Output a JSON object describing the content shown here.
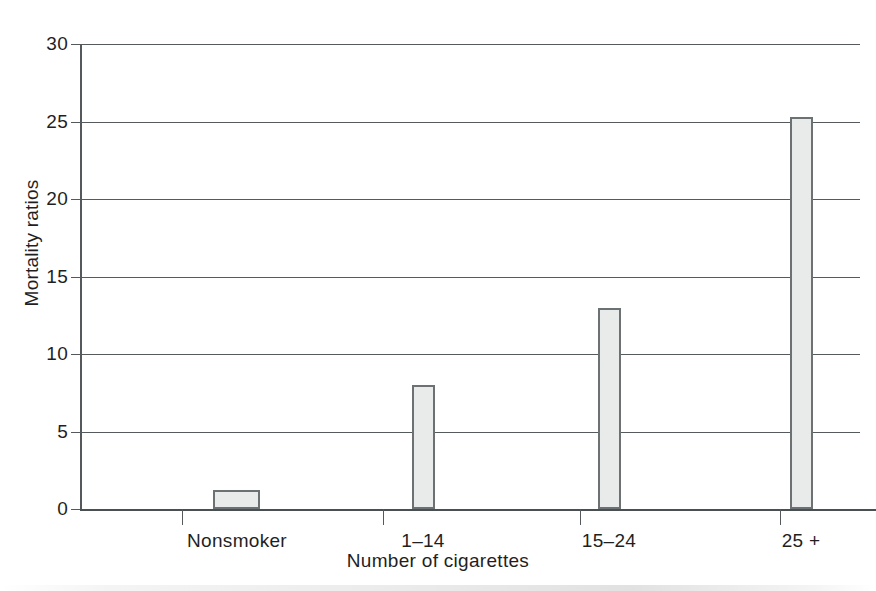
{
  "chart_data": {
    "type": "bar",
    "title": "",
    "xlabel": "Number of cigarettes",
    "ylabel": "Mortality ratios",
    "categories": [
      "Nonsmoker",
      "1–14",
      "15–24",
      "25 +"
    ],
    "values": [
      1.2,
      8,
      13,
      25.3
    ],
    "ylim": [
      0,
      30
    ],
    "yticks": [
      0,
      5,
      10,
      15,
      20,
      25,
      30
    ],
    "ytick_labels": [
      "0",
      "5",
      "10",
      "15",
      "20",
      "25",
      "30"
    ],
    "grid": "horizontal",
    "legend": "none",
    "bar_fill": "#e9eaea",
    "bar_border": "#6c7174",
    "axis_color": "#55595b",
    "background": "#ffffff"
  },
  "axes": {
    "y_title": "Mortality ratios",
    "x_title": "Number of cigarettes"
  },
  "bars": [
    {
      "label": "Nonsmoker",
      "value": 1.2
    },
    {
      "label": "1–14",
      "value": 8
    },
    {
      "label": "15–24",
      "value": 13
    },
    {
      "label": "25 +",
      "value": 25.3
    }
  ],
  "yticks": [
    {
      "label": "30",
      "value": 30
    },
    {
      "label": "25",
      "value": 25
    },
    {
      "label": "20",
      "value": 20
    },
    {
      "label": "15",
      "value": 15
    },
    {
      "label": "10",
      "value": 10
    },
    {
      "label": "5",
      "value": 5
    },
    {
      "label": "0",
      "value": 0
    }
  ]
}
